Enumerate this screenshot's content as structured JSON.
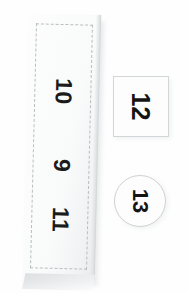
{
  "page": {
    "background_color": "#fefefe"
  },
  "strip": {
    "name": "vertical-label-strip",
    "cutline_style": "dashed",
    "cutline_color": "#b9bdbf",
    "paper_color": "#fbfbfc",
    "rotation_deg": 1.4,
    "numbers": [
      {
        "label": "10",
        "rotation_deg": 90
      },
      {
        "label": "9",
        "rotation_deg": 90
      },
      {
        "label": "11",
        "rotation_deg": 90
      }
    ]
  },
  "square_label": {
    "name": "square-label",
    "label": "12",
    "rotation_deg": 90,
    "border_color": "#d3d6d7",
    "fill_color": "#fdfdfd"
  },
  "circle_label": {
    "name": "circle-label",
    "label": "13",
    "rotation_deg": 90,
    "border_color": "#cfd2d3",
    "fill_color": "#fdfdfd"
  }
}
